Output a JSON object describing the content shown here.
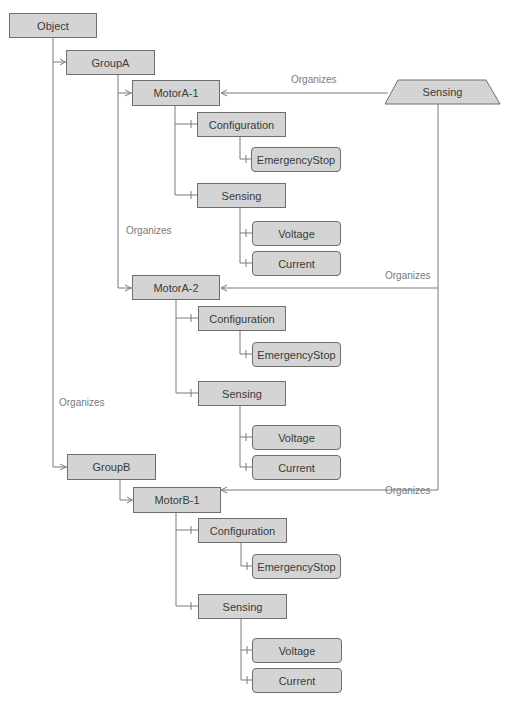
{
  "nodes": {
    "object": "Object",
    "group_a": "GroupA",
    "motor_a1": "MotorA-1",
    "motor_a1_config": "Configuration",
    "motor_a1_estop": "EmergencyStop",
    "motor_a1_sensing": "Sensing",
    "motor_a1_voltage": "Voltage",
    "motor_a1_current": "Current",
    "motor_a2": "MotorA-2",
    "motor_a2_config": "Configuration",
    "motor_a2_estop": "EmergencyStop",
    "motor_a2_sensing": "Sensing",
    "motor_a2_voltage": "Voltage",
    "motor_a2_current": "Current",
    "group_b": "GroupB",
    "motor_b1": "MotorB-1",
    "motor_b1_config": "Configuration",
    "motor_b1_estop": "EmergencyStop",
    "motor_b1_sensing": "Sensing",
    "motor_b1_voltage": "Voltage",
    "motor_b1_current": "Current",
    "sensing_type": "Sensing"
  },
  "edge_labels": {
    "sensing_to_a1": "Organizes",
    "sensing_to_a2": "Organizes",
    "sensing_to_b1": "Organizes",
    "group_a_to_a2": "Organizes",
    "object_to_group_b": "Organizes"
  },
  "colors": {
    "node_fill": "#d4d4d4",
    "node_border": "#6e6e6e",
    "line": "#7a7a7a",
    "label": "#7a7a7a"
  }
}
